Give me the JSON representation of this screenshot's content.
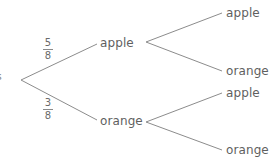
{
  "colors": {
    "line": "#8c8c8c",
    "text": "#5f5f5f",
    "background": "#ffffff"
  },
  "clipped_left_label": "s",
  "tree": {
    "root": {
      "x": 21,
      "y": 80
    },
    "level1": [
      {
        "label": "apple",
        "probability": {
          "numerator": "5",
          "denominator": "8"
        }
      },
      {
        "label": "orange",
        "probability": {
          "numerator": "3",
          "denominator": "8"
        }
      }
    ],
    "level2": [
      {
        "parent": "apple",
        "children": [
          {
            "label": "apple"
          },
          {
            "label": "orange"
          }
        ]
      },
      {
        "parent": "orange",
        "children": [
          {
            "label": "apple"
          },
          {
            "label": "orange"
          }
        ]
      }
    ]
  }
}
